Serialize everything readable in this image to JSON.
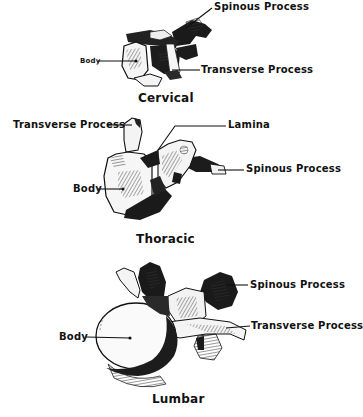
{
  "diagram": {
    "type": "anatomical-illustration",
    "panels": [
      {
        "title": "Cervical",
        "labels": {
          "spinous_process": "Spinous  Process",
          "body": "Body",
          "transverse_process": "Transverse  Process"
        }
      },
      {
        "title": "Thoracic",
        "labels": {
          "transverse_process": "Transverse  Process",
          "lamina": "Lamina",
          "spinous_process": "Spinous  Process",
          "body": "Body"
        }
      },
      {
        "title": "Lumbar",
        "labels": {
          "spinous_process": "Spinous  Process",
          "transverse_process": "Transverse  Process",
          "body": "Body"
        }
      }
    ]
  }
}
